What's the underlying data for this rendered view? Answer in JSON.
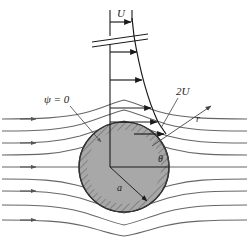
{
  "figure": {
    "name": "potential-flow-past-a-sphere",
    "background_color": "#ffffff",
    "line_color": "#555555",
    "dark_line_color": "#1a1a1a",
    "body_fill_color": "#a8a8a8",
    "body_edge_color": "#333333",
    "labels": {
      "freestream_velocity": "U",
      "max_velocity": "2U",
      "stream_function": "ψ = 0",
      "radius": "a",
      "radial_coordinate": "r",
      "angle": "θ"
    },
    "geometry": {
      "center_x": 124,
      "center_y": 167,
      "radius": 45,
      "axis_top_y": 10,
      "break_y": 38,
      "profile_top_y": 18,
      "profile_bottom_y": 135
    },
    "velocity_profile": {
      "description": "horizontal velocity arrows increasing from U far upstream to 2U at the sphere crest",
      "arrow_rows_y": [
        22,
        52,
        80,
        108,
        134
      ],
      "arrow_lengths": [
        22,
        26,
        31,
        36,
        41
      ]
    },
    "streamlines": {
      "count": 9,
      "inlet_arrow_rows": [
        1,
        3,
        5,
        7,
        9
      ]
    }
  }
}
